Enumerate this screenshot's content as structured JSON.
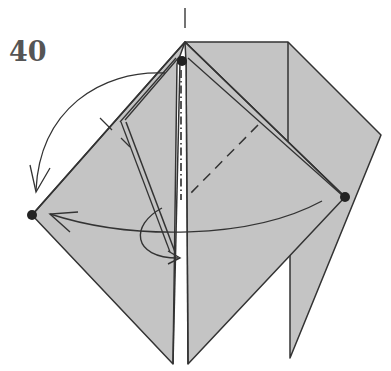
{
  "diagram": {
    "step_number": "40",
    "colors": {
      "paper": "#c4c4c4",
      "line": "#333333",
      "dot": "#222222",
      "background": "#ffffff",
      "step_text": "#555555"
    },
    "elements": [
      {
        "type": "reference-mark",
        "description": "vertical tick above top apex"
      },
      {
        "type": "dot",
        "label": "top point",
        "x": 182,
        "y": 61
      },
      {
        "type": "dot",
        "label": "left point",
        "x": 32,
        "y": 215
      },
      {
        "type": "dot",
        "label": "right point",
        "x": 345,
        "y": 197
      },
      {
        "type": "valley-fold-line",
        "description": "dashed diagonal on right flap"
      },
      {
        "type": "mountain-fold-line",
        "description": "dash-dot center line"
      },
      {
        "type": "arrow",
        "description": "curved arrow from top point swinging down to left"
      },
      {
        "type": "arrow",
        "description": "long curved arrow from right point to left point"
      },
      {
        "type": "arrow",
        "description": "small looping arrow near center bottom"
      }
    ]
  }
}
